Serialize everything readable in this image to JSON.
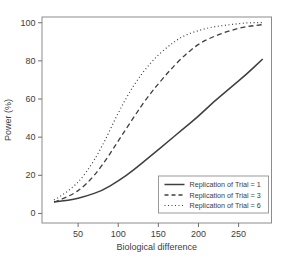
{
  "figure": {
    "background": "#ffffff",
    "curve_color": "#3f3f3f",
    "axis_color": "#8c8c8c",
    "tick_color": "#6e6e6e",
    "text_color": "#3d3d3d",
    "legend_border_color": "#9a9a9a"
  },
  "chart_data": {
    "type": "line",
    "xlabel": "Biological difference",
    "ylabel": "Power (%)",
    "xlim": [
      5,
      291
    ],
    "ylim": [
      -5,
      103
    ],
    "x_ticks": [
      50,
      100,
      150,
      200,
      250
    ],
    "y_ticks": [
      0,
      20,
      40,
      60,
      80,
      100
    ],
    "grid": false,
    "legend_position": "bottom-right",
    "x": [
      20,
      40,
      60,
      80,
      100,
      120,
      140,
      160,
      180,
      200,
      220,
      240,
      260,
      280
    ],
    "series": [
      {
        "name": "Replication of Trial = 1",
        "line_style": "solid",
        "values": [
          6,
          7,
          9,
          12,
          17,
          23,
          30,
          37,
          44,
          51,
          59,
          66,
          73,
          81
        ]
      },
      {
        "name": "Replication of Trial = 3",
        "line_style": "dashed",
        "values": [
          6,
          9,
          15,
          25,
          38,
          51,
          63,
          73,
          82,
          89,
          93,
          96,
          98,
          99
        ]
      },
      {
        "name": "Replication of Trial = 6",
        "line_style": "dotted",
        "values": [
          7,
          12,
          21,
          35,
          53,
          68,
          79,
          87,
          93,
          96,
          98,
          99,
          100,
          100
        ]
      }
    ]
  }
}
